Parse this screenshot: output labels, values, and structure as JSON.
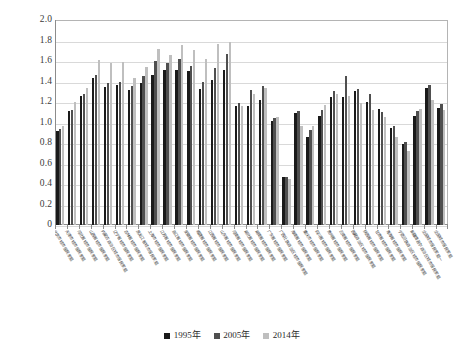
{
  "chart_data": {
    "type": "bar",
    "title": "",
    "subtitle": "",
    "xlabel": "",
    "ylabel": "",
    "ylim": [
      0,
      2.0
    ],
    "ytick_step": 0.2,
    "yticks": [
      "2.0",
      "1.8",
      "1.6",
      "1.4",
      "1.2",
      "1.0",
      "0.8",
      "0.6",
      "0.4",
      "0.2",
      "0"
    ],
    "grid": true,
    "legend_position": "bottom-center",
    "categories": [
      "北京市城市居民家庭",
      "天津市城市居民家庭",
      "河北省城市居民家庭",
      "山西省城市居民家庭",
      "内蒙古自治区城市居民家庭",
      "辽宁省城市居民家庭",
      "吉林省城市居民家庭",
      "黑龙江省城市居民家庭",
      "上海市城市居民家庭",
      "江苏省城市居民家庭",
      "浙江省城市居民家庭",
      "安徽省城市居民家庭",
      "福建省城市居民家庭",
      "江西省城市居民家庭",
      "山东省城市居民家庭",
      "河南省城市居民家庭",
      "湖北省城市居民家庭",
      "湖南省城市居民家庭",
      "广东省城市居民家庭",
      "广西壮族自治区城市居民家庭",
      "海南省城市居民家庭",
      "重庆市城市居民家庭",
      "四川省城市居民家庭",
      "贵州省城市居民家庭",
      "云南省城市居民家庭",
      "西藏自治区城市居民家庭",
      "陕西省城市居民家庭",
      "甘肃省城市居民家庭",
      "青海省城市居民家庭",
      "宁夏回族自治区城市居民家庭",
      "新疆维吾尔自治区城市居民家庭",
      "全国城市居民家庭一",
      "全国城市居民家庭"
    ],
    "series": [
      {
        "name": "1995年",
        "color": "#1a1a1a",
        "values": [
          0.92,
          1.11,
          1.26,
          1.43,
          1.35,
          1.37,
          1.32,
          1.39,
          1.46,
          1.51,
          1.51,
          1.5,
          1.33,
          1.41,
          1.51,
          1.16,
          1.16,
          1.22,
          1.01,
          0.47,
          1.09,
          0.86,
          1.06,
          1.25,
          1.25,
          1.31,
          1.2,
          1.13,
          0.95,
          0.79,
          1.06,
          1.34,
          1.14
        ]
      },
      {
        "name": "2005年",
        "color": "#4f4f4f",
        "values": [
          0.94,
          1.12,
          1.28,
          1.46,
          1.39,
          1.4,
          1.36,
          1.45,
          1.6,
          1.58,
          1.62,
          1.55,
          1.4,
          1.53,
          1.67,
          1.19,
          1.32,
          1.36,
          1.04,
          0.47,
          1.11,
          0.93,
          1.12,
          1.31,
          1.45,
          1.33,
          1.28,
          1.1,
          0.97,
          0.81,
          1.11,
          1.37,
          1.18
        ]
      },
      {
        "name": "2014年",
        "color": "#bfbfbf",
        "values": [
          0.97,
          1.2,
          1.34,
          1.61,
          1.58,
          1.59,
          1.43,
          1.54,
          1.72,
          1.66,
          1.76,
          1.71,
          1.62,
          1.77,
          1.79,
          1.16,
          1.28,
          1.34,
          1.05,
          0.45,
          0.97,
          0.97,
          1.17,
          1.28,
          1.26,
          1.19,
          1.12,
          1.05,
          0.86,
          0.72,
          1.13,
          1.22,
          1.12
        ]
      }
    ]
  },
  "legend": {
    "items": [
      {
        "label": "1995年",
        "color": "#1a1a1a"
      },
      {
        "label": "2005年",
        "color": "#4f4f4f"
      },
      {
        "label": "2014年",
        "color": "#bfbfbf"
      }
    ]
  }
}
